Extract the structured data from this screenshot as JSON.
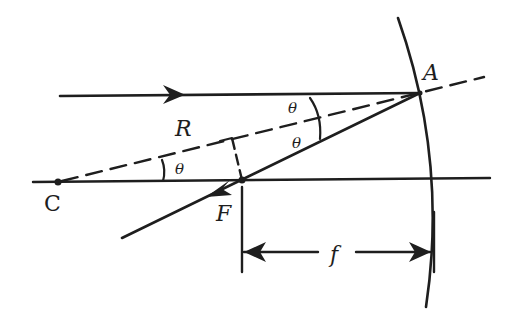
{
  "diagram": {
    "colors": {
      "ink": "#1e1e1e",
      "background": "#ffffff"
    },
    "points": [
      {
        "id": "C",
        "label": "C"
      },
      {
        "id": "A",
        "label": "A"
      },
      {
        "id": "F",
        "label": "F"
      }
    ],
    "labels": {
      "radius": "R",
      "angle_incident": "θ",
      "angle_reflected": "θ",
      "angle_center": "θ",
      "focal_length": "f",
      "point_C": "C",
      "point_A": "A",
      "point_F": "F"
    },
    "elements": [
      "incident ray parallel to axis with arrow",
      "mirror arc",
      "optical axis",
      "dashed radius line from C through A",
      "reflected ray through F with arrow",
      "perpendicular dashed line from F to radius (right angle)",
      "focal length dimension arrow"
    ]
  }
}
